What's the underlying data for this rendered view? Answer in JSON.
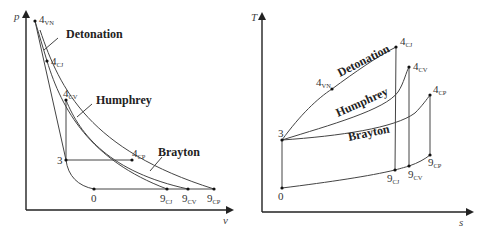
{
  "figure": {
    "pv_diagram": {
      "y_axis_label": "p",
      "x_axis_label": "v",
      "cycle_labels": {
        "detonation": "Detonation",
        "humphrey": "Humphrey",
        "brayton": "Brayton"
      },
      "points": {
        "p4vn": {
          "main": "4",
          "sub": "VN"
        },
        "p4cj": {
          "main": "4",
          "sub": "CJ"
        },
        "p4cv": {
          "main": "4",
          "sub": "CV"
        },
        "p4cp": {
          "main": "4",
          "sub": "CP"
        },
        "p3": {
          "main": "3",
          "sub": ""
        },
        "p0": {
          "main": "0",
          "sub": ""
        },
        "p9cj": {
          "main": "9",
          "sub": "CJ"
        },
        "p9cv": {
          "main": "9",
          "sub": "CV"
        },
        "p9cp": {
          "main": "9",
          "sub": "CP"
        }
      }
    },
    "ts_diagram": {
      "y_axis_label": "T",
      "x_axis_label": "s",
      "cycle_labels": {
        "detonation": "Detonation",
        "humphrey": "Humphrey",
        "brayton": "Brayton"
      },
      "points": {
        "p4vn": {
          "main": "4",
          "sub": "VN"
        },
        "p4cj": {
          "main": "4",
          "sub": "CJ"
        },
        "p4cv": {
          "main": "4",
          "sub": "CV"
        },
        "p4cp": {
          "main": "4",
          "sub": "CP"
        },
        "p3": {
          "main": "3",
          "sub": ""
        },
        "p0": {
          "main": "0",
          "sub": ""
        },
        "p9cj": {
          "main": "9",
          "sub": "CJ"
        },
        "p9cv": {
          "main": "9",
          "sub": "CV"
        },
        "p9cp": {
          "main": "9",
          "sub": "CP"
        }
      }
    }
  }
}
